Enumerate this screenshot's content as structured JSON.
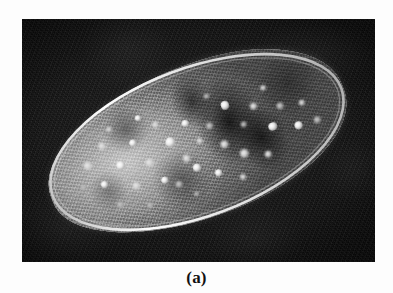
{
  "figure": {
    "caption": "(a)",
    "panel_label": "a",
    "type": "micrograph",
    "orientation_degrees": -20.5,
    "colors": {
      "background": "#0e0e0e",
      "page": "#ffffff",
      "cell_membrane": "#ebebeb",
      "cytoplasm_mid": "#8a8a8a",
      "cytoplasm_dark": "#3a3a3a",
      "granule_bright": "#ffffff",
      "caption_text": "#111111"
    },
    "plate": {
      "x": 22,
      "y": 19,
      "width": 353,
      "height": 243
    },
    "cell": {
      "x": 19,
      "y": 47,
      "width": 312,
      "height": 152
    },
    "granules": [
      {
        "cx": 14.5,
        "cy": 40.0,
        "r": 4.6,
        "style": "soft"
      },
      {
        "cx": 17.5,
        "cy": 55.0,
        "r": 3.4,
        "style": "bright"
      },
      {
        "cx": 11.0,
        "cy": 52.0,
        "r": 3.0,
        "style": "dim"
      },
      {
        "cx": 21.0,
        "cy": 31.0,
        "r": 3.8,
        "style": "soft"
      },
      {
        "cx": 24.5,
        "cy": 47.0,
        "r": 4.2,
        "style": "bright"
      },
      {
        "cx": 27.0,
        "cy": 63.0,
        "r": 4.0,
        "style": "soft"
      },
      {
        "cx": 20.0,
        "cy": 71.0,
        "r": 3.2,
        "style": "dim"
      },
      {
        "cx": 30.5,
        "cy": 36.0,
        "r": 3.6,
        "style": "bright"
      },
      {
        "cx": 33.5,
        "cy": 52.0,
        "r": 4.4,
        "style": "soft"
      },
      {
        "cx": 36.0,
        "cy": 66.0,
        "r": 3.4,
        "style": "bright"
      },
      {
        "cx": 29.0,
        "cy": 78.0,
        "r": 3.0,
        "style": "dim"
      },
      {
        "cx": 39.5,
        "cy": 30.0,
        "r": 3.2,
        "style": "soft"
      },
      {
        "cx": 42.0,
        "cy": 44.0,
        "r": 4.8,
        "style": "bright"
      },
      {
        "cx": 45.0,
        "cy": 58.0,
        "r": 3.8,
        "style": "soft"
      },
      {
        "cx": 40.0,
        "cy": 72.0,
        "r": 3.4,
        "style": "dim"
      },
      {
        "cx": 48.5,
        "cy": 36.0,
        "r": 3.6,
        "style": "bright"
      },
      {
        "cx": 51.0,
        "cy": 50.0,
        "r": 3.0,
        "style": "soft"
      },
      {
        "cx": 47.0,
        "cy": 66.0,
        "r": 4.0,
        "style": "bright"
      },
      {
        "cx": 55.5,
        "cy": 43.0,
        "r": 3.4,
        "style": "dim"
      },
      {
        "cx": 58.0,
        "cy": 58.0,
        "r": 3.8,
        "style": "soft"
      },
      {
        "cx": 53.0,
        "cy": 74.0,
        "r": 3.2,
        "style": "bright"
      },
      {
        "cx": 62.5,
        "cy": 34.0,
        "r": 4.4,
        "style": "bright"
      },
      {
        "cx": 66.0,
        "cy": 50.0,
        "r": 3.0,
        "style": "dim"
      },
      {
        "cx": 63.0,
        "cy": 68.0,
        "r": 4.6,
        "style": "soft"
      },
      {
        "cx": 71.0,
        "cy": 41.0,
        "r": 3.4,
        "style": "soft"
      },
      {
        "cx": 74.5,
        "cy": 58.0,
        "r": 4.2,
        "style": "bright"
      },
      {
        "cx": 70.0,
        "cy": 74.0,
        "r": 3.6,
        "style": "soft"
      },
      {
        "cx": 79.0,
        "cy": 47.0,
        "r": 3.2,
        "style": "dim"
      },
      {
        "cx": 82.5,
        "cy": 63.0,
        "r": 4.0,
        "style": "bright"
      },
      {
        "cx": 86.0,
        "cy": 50.0,
        "r": 3.0,
        "style": "soft"
      },
      {
        "cx": 88.5,
        "cy": 64.0,
        "r": 3.4,
        "style": "dim"
      },
      {
        "cx": 25.0,
        "cy": 22.0,
        "r": 2.8,
        "style": "soft"
      },
      {
        "cx": 35.0,
        "cy": 22.0,
        "r": 3.0,
        "style": "bright"
      },
      {
        "cx": 58.0,
        "cy": 24.0,
        "r": 2.6,
        "style": "dim"
      },
      {
        "cx": 76.0,
        "cy": 32.0,
        "r": 2.8,
        "style": "soft"
      },
      {
        "cx": 44.0,
        "cy": 82.0,
        "r": 2.6,
        "style": "dim"
      },
      {
        "cx": 60.0,
        "cy": 82.0,
        "r": 3.0,
        "style": "soft"
      }
    ]
  }
}
